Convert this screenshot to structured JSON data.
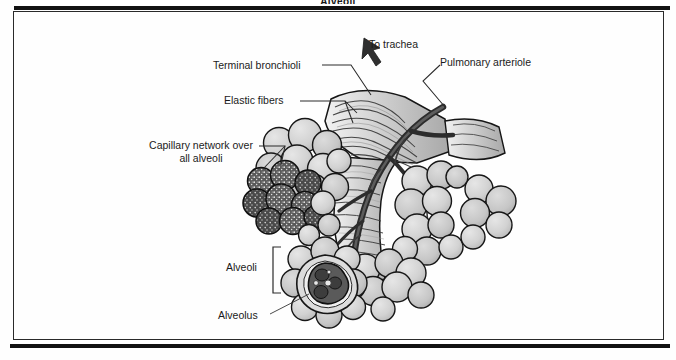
{
  "figure": {
    "caption": "Alveoli",
    "title": "Alveoli",
    "background_color": "#fefefe",
    "frame_color": "#2a2a2a",
    "rule_color": "#111111"
  },
  "labels": {
    "to_trachea": "To trachea",
    "terminal_bronchioli": "Terminal bronchioli",
    "pulmonary_arteriole": "Pulmonary arteriole",
    "elastic_fibers": "Elastic fibers",
    "capillary_network": "Capillary network over all alveoli",
    "alveoli": "Alveoli",
    "alveolus": "Alveolus"
  },
  "icons": {
    "trachea_arrow": "up-left-arrow-icon",
    "alveoli_bracket": "square-bracket-icon"
  },
  "palette": {
    "alveolus_fill": "#cfcfcf",
    "alveolus_fill_light": "#dedede",
    "alveolus_shadow": "#b3b3b3",
    "capillary_dark": "#5a5a5a",
    "capillary_darker": "#474747",
    "vessel_dark": "#2c2c2c",
    "bronchiole_fill": "#d6d6d6",
    "outline": "#161616",
    "leader_line": "#2a2a2a",
    "text": "#1b1b1b"
  }
}
